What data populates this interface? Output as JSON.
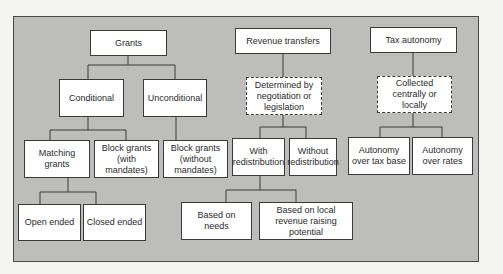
{
  "diagram": {
    "type": "hierarchy",
    "columns": [
      {
        "root": "Grants",
        "children": [
          {
            "label": "Conditional",
            "children": [
              {
                "label": "Matching grants",
                "children": [
                  {
                    "label": "Open ended"
                  },
                  {
                    "label": "Closed ended"
                  }
                ]
              },
              {
                "label": "Block grants (with mandates)"
              }
            ]
          },
          {
            "label": "Unconditional",
            "children": [
              {
                "label": "Block grants (without mandates)"
              }
            ]
          }
        ]
      },
      {
        "root": "Revenue transfers",
        "children": [
          {
            "label": "Determined by negotiation or legislation",
            "style": "dashed",
            "children": [
              {
                "label": "With redistribution",
                "children": [
                  {
                    "label": "Based on needs"
                  },
                  {
                    "label": "Based on local revenue raising potential"
                  }
                ]
              },
              {
                "label": "Without redistribution"
              }
            ]
          }
        ]
      },
      {
        "root": "Tax autonomy",
        "children": [
          {
            "label": "Collected centrally or locally",
            "style": "dashed",
            "children": [
              {
                "label": "Autonomy over tax base"
              },
              {
                "label": "Autonomy over rates"
              }
            ]
          }
        ]
      }
    ]
  },
  "labels": {
    "grants": "Grants",
    "conditional": "Conditional",
    "unconditional": "Unconditional",
    "matching": "Matching grants",
    "block_with": "Block grants (with mandates)",
    "block_without": "Block grants (without mandates)",
    "open_ended": "Open ended",
    "closed_ended": "Closed ended",
    "revenue_transfers": "Revenue transfers",
    "determined": "Determined by negotiation or legislation",
    "with_redist": "With redistribution",
    "without_redist": "Without redistribution",
    "based_needs": "Based on needs",
    "based_local": "Based on local revenue raising potential",
    "tax_autonomy": "Tax autonomy",
    "collected": "Collected centrally or locally",
    "autonomy_base": "Autonomy over tax base",
    "autonomy_rates": "Autonomy over rates"
  },
  "colors": {
    "background": "#bdbdbb",
    "box": "#ffffff",
    "border": "#3a3a3a"
  }
}
